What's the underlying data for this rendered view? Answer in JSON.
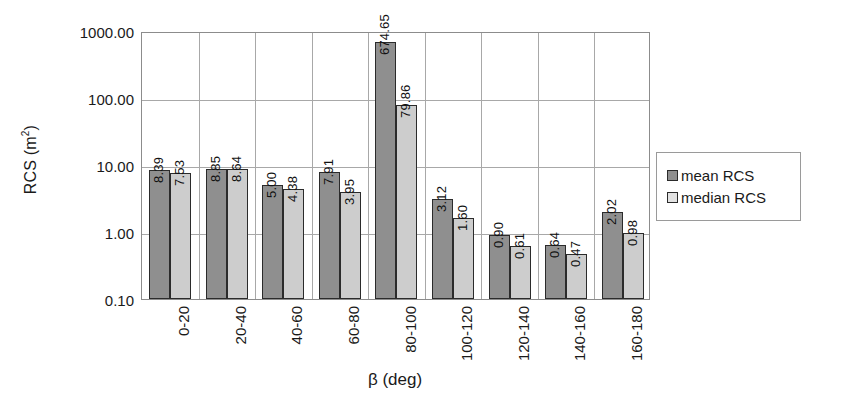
{
  "chart_data": {
    "type": "bar",
    "title": "",
    "xlabel": "β (deg)",
    "ylabel": "RCS (m²)",
    "yscale": "log",
    "ylim": [
      0.1,
      1000.0
    ],
    "ytick_labels": [
      "1000.00",
      "100.00",
      "10.00",
      "1.00",
      "0.10"
    ],
    "ytick_values": [
      1000.0,
      100.0,
      10.0,
      1.0,
      0.1
    ],
    "grid": true,
    "legend_position": "right",
    "categories": [
      "0-20",
      "20-40",
      "40-60",
      "60-80",
      "80-100",
      "100-120",
      "120-140",
      "140-160",
      "160-180"
    ],
    "series": [
      {
        "name": "mean RCS",
        "color": "#8f8f8f",
        "values": [
          8.39,
          8.85,
          5.0,
          7.91,
          674.65,
          3.12,
          0.9,
          0.64,
          2.02
        ],
        "labels": [
          "8.39",
          "8.85",
          "5.00",
          "7.91",
          "674.65",
          "3.12",
          "0.90",
          "0.64",
          "2.02"
        ]
      },
      {
        "name": "median RCS",
        "color": "#cdcdcd",
        "values": [
          7.53,
          8.64,
          4.38,
          3.95,
          79.86,
          1.6,
          0.61,
          0.47,
          0.98
        ],
        "labels": [
          "7.53",
          "8.64",
          "4.38",
          "3.95",
          "79.86",
          "1.60",
          "0.61",
          "0.47",
          "0.98"
        ]
      }
    ]
  },
  "legend": {
    "items": [
      {
        "label": "mean RCS",
        "swatch": "mean"
      },
      {
        "label": "median RCS",
        "swatch": "median"
      }
    ]
  },
  "axis": {
    "y_title_main": "RCS (m",
    "y_title_sup": "2",
    "y_title_close": ")",
    "x_title": "β (deg)"
  }
}
